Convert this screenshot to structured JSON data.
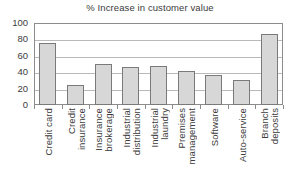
{
  "chart_data": {
    "type": "bar",
    "title": "% Increase in customer value",
    "xlabel": "",
    "ylabel": "",
    "ylim": [
      0,
      100
    ],
    "yticks": [
      0,
      20,
      40,
      60,
      80,
      100
    ],
    "grid": true,
    "legend": "none",
    "categories": [
      "Credit card",
      "Credit insurance",
      "Insurance brokerage",
      "Industrial distribution",
      "Industrial laundry",
      "Premises management",
      "Software",
      "Auto-service",
      "Branch deposits"
    ],
    "category_lines": [
      [
        "Credit card"
      ],
      [
        "Credit",
        "insurance"
      ],
      [
        "Insurance",
        "brokerage"
      ],
      [
        "Industrial",
        "distribution"
      ],
      [
        "Industrial",
        "laundry"
      ],
      [
        "Premises",
        "management"
      ],
      [
        "Software"
      ],
      [
        "Auto-service"
      ],
      [
        "Branch",
        "deposits"
      ]
    ],
    "values": [
      76,
      25,
      50,
      46,
      47,
      42,
      36,
      30,
      87
    ],
    "colors": {
      "bar_fill": "#d7d7d7",
      "bar_border": "#7a7a7a",
      "gridline": "#b9b9b9",
      "frame": "#8c8c8c",
      "text": "#3b3b3b",
      "background": "#ffffff"
    }
  }
}
